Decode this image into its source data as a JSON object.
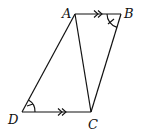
{
  "diagram": {
    "type": "geometry-figure",
    "background": "#ffffff",
    "stroke_color": "#111111",
    "vertices": [
      {
        "name": "A",
        "x": 75,
        "y": 14,
        "label_x": 62,
        "label_y": 18
      },
      {
        "name": "B",
        "x": 121,
        "y": 14,
        "label_x": 124,
        "label_y": 18
      },
      {
        "name": "C",
        "x": 91,
        "y": 112,
        "label_x": 88,
        "label_y": 129
      },
      {
        "name": "D",
        "x": 22,
        "y": 112,
        "label_x": 8,
        "label_y": 124
      }
    ],
    "segments": [
      {
        "from": "A",
        "to": "B",
        "parallel_mark": "double-arrow"
      },
      {
        "from": "B",
        "to": "C"
      },
      {
        "from": "C",
        "to": "D",
        "parallel_mark": "double-arrow"
      },
      {
        "from": "D",
        "to": "A"
      },
      {
        "from": "A",
        "to": "C",
        "note": "diagonal"
      }
    ],
    "angle_marks": [
      {
        "vertex": "B",
        "between": [
          "A",
          "C"
        ],
        "style": "arc-with-tick"
      },
      {
        "vertex": "D",
        "between": [
          "A",
          "C"
        ],
        "style": "arc-with-tick"
      }
    ],
    "labels": {
      "A": "A",
      "B": "B",
      "C": "C",
      "D": "D"
    }
  }
}
